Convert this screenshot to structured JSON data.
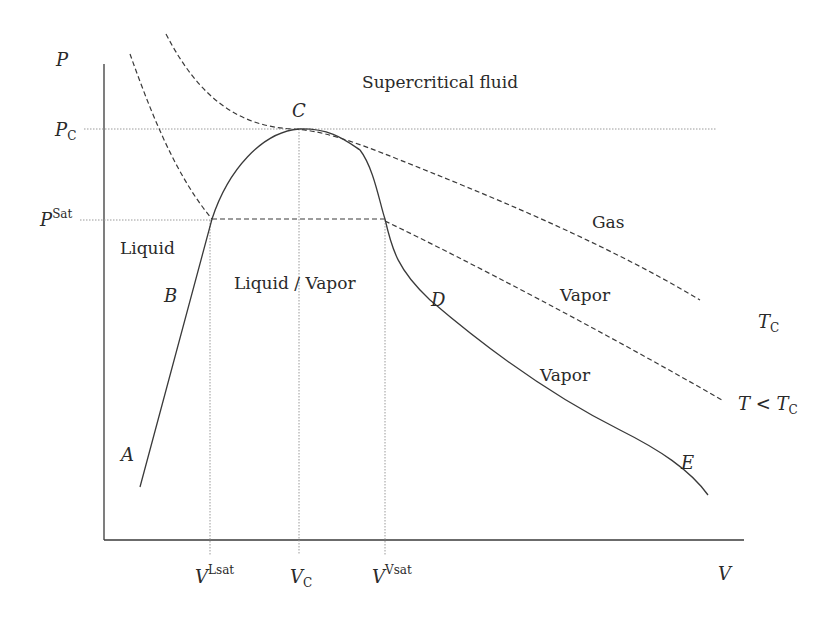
{
  "diagram": {
    "axes": {
      "y_label": "P",
      "x_label": "V",
      "y_ticks": [
        {
          "main": "P",
          "sub": "C",
          "kind": "subscript"
        },
        {
          "main": "P",
          "sup": "Sat",
          "kind": "superscript"
        }
      ],
      "x_ticks": [
        {
          "main": "V",
          "sup": "Lsat",
          "kind": "superscript"
        },
        {
          "main": "V",
          "sub": "C",
          "kind": "subscript"
        },
        {
          "main": "V",
          "sup": "Vsat",
          "kind": "superscript"
        }
      ]
    },
    "regions": {
      "supercritical": "Supercritical fluid",
      "gas": "Gas",
      "liquid": "Liquid",
      "liquid_vapor": "Liquid / Vapor",
      "vapor_upper": "Vapor",
      "vapor_lower": "Vapor"
    },
    "points": {
      "A": "A",
      "B": "B",
      "C": "C",
      "D": "D",
      "E": "E"
    },
    "isotherms": {
      "critical": {
        "main": "T",
        "sub": "C"
      },
      "subcritical": {
        "main": "T < T",
        "sub": "C"
      }
    },
    "colors": {
      "line": "#3a3a3a",
      "guide": "#9a9a9a",
      "background": "#ffffff"
    }
  }
}
